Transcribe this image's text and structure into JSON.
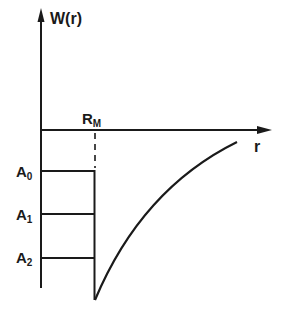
{
  "diagram": {
    "y_axis_label": "W(r)",
    "x_axis_label": "r",
    "marker_label": {
      "main": "R",
      "sub": "M"
    },
    "levels": [
      {
        "main": "A",
        "sub": "0"
      },
      {
        "main": "A",
        "sub": "1"
      },
      {
        "main": "A",
        "sub": "2"
      }
    ],
    "colors": {
      "ink": "#1a1a1a",
      "background": "#ffffff"
    }
  }
}
